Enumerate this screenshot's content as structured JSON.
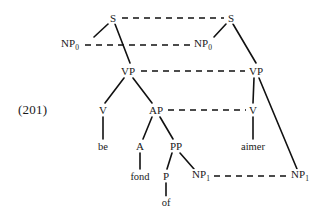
{
  "figure": {
    "example_number": "(201)",
    "background_color": "#ffffff",
    "line_color": "#111111",
    "nodes": [
      {
        "id": "s_left",
        "label": "S",
        "sub": "",
        "x": 113,
        "y": 18
      },
      {
        "id": "s_right",
        "label": "S",
        "sub": "",
        "x": 231,
        "y": 18
      },
      {
        "id": "np0_left",
        "label": "NP",
        "sub": "0",
        "x": 70,
        "y": 45
      },
      {
        "id": "np0_right",
        "label": "NP",
        "sub": "0",
        "x": 203,
        "y": 45
      },
      {
        "id": "vp_left",
        "label": "VP",
        "sub": "",
        "x": 128,
        "y": 71
      },
      {
        "id": "vp_right",
        "label": "VP",
        "sub": "",
        "x": 256,
        "y": 71
      },
      {
        "id": "v_left",
        "label": "V",
        "sub": "",
        "x": 103,
        "y": 110
      },
      {
        "id": "ap",
        "label": "AP",
        "sub": "",
        "x": 156,
        "y": 110
      },
      {
        "id": "v_right",
        "label": "V",
        "sub": "",
        "x": 253,
        "y": 110
      },
      {
        "id": "be",
        "label": "be",
        "sub": "",
        "x": 103,
        "y": 146
      },
      {
        "id": "a",
        "label": "A",
        "sub": "",
        "x": 140,
        "y": 146
      },
      {
        "id": "pp",
        "label": "PP",
        "sub": "",
        "x": 176,
        "y": 146
      },
      {
        "id": "aimer",
        "label": "aimer",
        "sub": "",
        "x": 253,
        "y": 146
      },
      {
        "id": "fond",
        "label": "fond",
        "sub": "",
        "x": 140,
        "y": 176
      },
      {
        "id": "p",
        "label": "P",
        "sub": "",
        "x": 166,
        "y": 176
      },
      {
        "id": "np1_left",
        "label": "NP",
        "sub": "1",
        "x": 201,
        "y": 176
      },
      {
        "id": "np1_right",
        "label": "NP",
        "sub": "1",
        "x": 300,
        "y": 176
      },
      {
        "id": "of",
        "label": "of",
        "sub": "",
        "x": 166,
        "y": 202
      }
    ],
    "tree_edges": [
      {
        "from": "s_left",
        "to": "np0_left",
        "x1": 108,
        "y1": 24,
        "x2": 94,
        "y2": 37
      },
      {
        "from": "s_left",
        "to": "vp_left",
        "x1": 115,
        "y1": 24,
        "x2": 130,
        "y2": 63
      },
      {
        "from": "s_right",
        "to": "np0_right",
        "x1": 226,
        "y1": 24,
        "x2": 214,
        "y2": 37
      },
      {
        "from": "s_right",
        "to": "vp_right",
        "x1": 233,
        "y1": 24,
        "x2": 256,
        "y2": 63
      },
      {
        "from": "vp_left",
        "to": "v_left",
        "x1": 124,
        "y1": 78,
        "x2": 105,
        "y2": 103
      },
      {
        "from": "vp_left",
        "to": "ap",
        "x1": 133,
        "y1": 78,
        "x2": 152,
        "y2": 103
      },
      {
        "from": "vp_right",
        "to": "v_right",
        "x1": 254,
        "y1": 78,
        "x2": 253,
        "y2": 103
      },
      {
        "from": "vp_right",
        "to": "np1_right",
        "x1": 259,
        "y1": 78,
        "x2": 297,
        "y2": 169
      },
      {
        "from": "v_left",
        "to": "be",
        "x1": 103,
        "y1": 117,
        "x2": 103,
        "y2": 139
      },
      {
        "from": "ap",
        "to": "a",
        "x1": 152,
        "y1": 117,
        "x2": 143,
        "y2": 139
      },
      {
        "from": "ap",
        "to": "pp",
        "x1": 160,
        "y1": 117,
        "x2": 173,
        "y2": 139
      },
      {
        "from": "v_right",
        "to": "aimer",
        "x1": 253,
        "y1": 117,
        "x2": 253,
        "y2": 139
      },
      {
        "from": "a",
        "to": "fond",
        "x1": 140,
        "y1": 153,
        "x2": 140,
        "y2": 169
      },
      {
        "from": "pp",
        "to": "p",
        "x1": 172,
        "y1": 153,
        "x2": 167,
        "y2": 169
      },
      {
        "from": "pp",
        "to": "np1_left",
        "x1": 180,
        "y1": 153,
        "x2": 194,
        "y2": 169
      },
      {
        "from": "p",
        "to": "of",
        "x1": 166,
        "y1": 183,
        "x2": 166,
        "y2": 196
      }
    ],
    "correspondence_links": [
      {
        "from": "s_left",
        "to": "s_right",
        "x1": 122,
        "y1": 18,
        "x2": 224,
        "y2": 18
      },
      {
        "from": "np0_left",
        "to": "np0_right",
        "x1": 85,
        "y1": 45,
        "x2": 191,
        "y2": 45
      },
      {
        "from": "vp_left",
        "to": "vp_right",
        "x1": 141,
        "y1": 71,
        "x2": 245,
        "y2": 71
      },
      {
        "from": "ap",
        "to": "v_right",
        "x1": 168,
        "y1": 110,
        "x2": 246,
        "y2": 110
      },
      {
        "from": "np1_left",
        "to": "np1_right",
        "x1": 214,
        "y1": 176,
        "x2": 288,
        "y2": 176
      }
    ]
  }
}
